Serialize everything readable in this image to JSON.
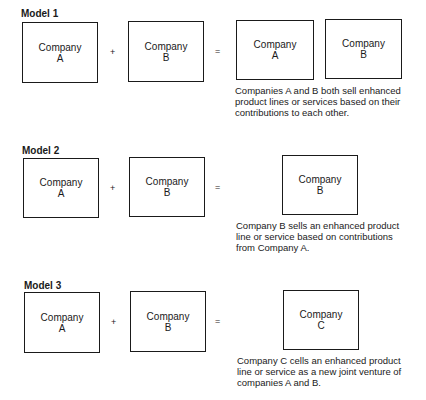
{
  "models": [
    {
      "label": "Model 1",
      "inputs": [
        {
          "name": "Company",
          "letter": "A"
        },
        {
          "name": "Company",
          "letter": "B"
        }
      ],
      "plus": "+",
      "equals": "=",
      "results": [
        {
          "name": "Company",
          "letter": "A"
        },
        {
          "name": "Company",
          "letter": "B"
        }
      ],
      "caption": "Companies A and B both sell enhanced product lines or services based on their contributions to each other."
    },
    {
      "label": "Model 2",
      "inputs": [
        {
          "name": "Company",
          "letter": "A"
        },
        {
          "name": "Company",
          "letter": "B"
        }
      ],
      "plus": "+",
      "equals": "=",
      "results": [
        {
          "name": "Company",
          "letter": "B"
        }
      ],
      "caption": "Company B sells an enhanced product line or service based on contributions from Company A."
    },
    {
      "label": "Model 3",
      "inputs": [
        {
          "name": "Company",
          "letter": "A"
        },
        {
          "name": "Company",
          "letter": "B"
        }
      ],
      "plus": "+",
      "equals": "=",
      "results": [
        {
          "name": "Company",
          "letter": "C"
        }
      ],
      "caption": "Company C cells an enhanced product line or service as a new joint venture of companies A and B."
    }
  ]
}
